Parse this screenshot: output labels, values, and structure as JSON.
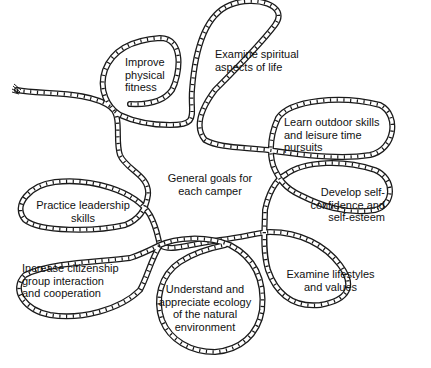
{
  "diagram": {
    "center": {
      "label": "General goals for\neach camper"
    },
    "goals": [
      {
        "id": "physical",
        "label": "Improve\nphysical\nfitness"
      },
      {
        "id": "spiritual",
        "label": "Examine spiritual\naspects of life"
      },
      {
        "id": "outdoor",
        "label": "Learn outdoor skills\nand leisure time\npursuits"
      },
      {
        "id": "confidence",
        "label": "Develop self-\nconfidence and\nself-esteem"
      },
      {
        "id": "lifestyles",
        "label": "Examine lifestyles\nand values"
      },
      {
        "id": "ecology",
        "label": "Understand and\nappreciate ecology\nof the natural\nenvironment"
      },
      {
        "id": "citizenship",
        "label": "Increase citizenship\ngroup interaction\nand cooperation"
      },
      {
        "id": "leadership",
        "label": "Practice leadership\nskills"
      }
    ],
    "colors": {
      "rope": "#1a1a1a",
      "background": "#ffffff",
      "text": "#111111"
    }
  }
}
